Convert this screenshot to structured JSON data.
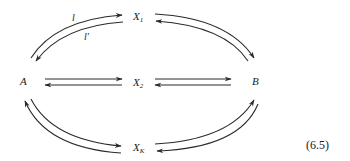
{
  "diagram": {
    "type": "reaction-network",
    "nodes": {
      "A": {
        "label": "A"
      },
      "B": {
        "label": "B"
      },
      "X1": {
        "label": "X",
        "sub": "1"
      },
      "X2": {
        "label": "X",
        "sub": "2"
      },
      "XK": {
        "label": "X",
        "sub": "K"
      }
    },
    "edge_labels": {
      "l": "l",
      "l_prime": "l′"
    },
    "edges": [
      {
        "from": "A",
        "to": "X1",
        "label": "l"
      },
      {
        "from": "X1",
        "to": "A",
        "label": "l′"
      },
      {
        "from": "X1",
        "to": "B"
      },
      {
        "from": "B",
        "to": "X1"
      },
      {
        "from": "A",
        "to": "X2"
      },
      {
        "from": "X2",
        "to": "A"
      },
      {
        "from": "X2",
        "to": "B"
      },
      {
        "from": "B",
        "to": "X2"
      },
      {
        "from": "A",
        "to": "XK"
      },
      {
        "from": "XK",
        "to": "A"
      },
      {
        "from": "XK",
        "to": "B"
      },
      {
        "from": "B",
        "to": "XK"
      }
    ],
    "equation_number": "(6.5)",
    "colors": {
      "stroke": "#2a2a2a",
      "text": "#1a1a1a",
      "background": "#ffffff"
    }
  }
}
